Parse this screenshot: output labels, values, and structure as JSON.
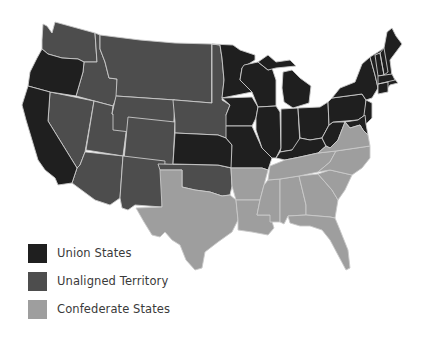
{
  "map": {
    "subject": "United States during the Civil War",
    "colors": {
      "union": "#1f1f1f",
      "unaligned": "#4d4d4d",
      "confederate": "#9e9e9e",
      "border": "#c9c9c9",
      "background": "#ffffff"
    },
    "regions": {
      "union": [
        "Washington? no",
        "Oregon",
        "California",
        "Kansas",
        "Minnesota",
        "Iowa",
        "Missouri",
        "Wisconsin",
        "Illinois",
        "Michigan",
        "Indiana",
        "Ohio",
        "Kentucky",
        "West Virginia",
        "Pennsylvania",
        "New York",
        "New Jersey",
        "Delaware",
        "Maryland",
        "Connecticut",
        "Rhode Island",
        "Massachusetts",
        "Vermont",
        "New Hampshire",
        "Maine"
      ],
      "unaligned": [
        "Washington",
        "Idaho",
        "Montana",
        "Nevada",
        "Utah",
        "Wyoming",
        "Colorado",
        "Arizona",
        "New Mexico",
        "North Dakota",
        "South Dakota",
        "Nebraska",
        "Oklahoma"
      ],
      "confederate": [
        "Texas",
        "Arkansas",
        "Louisiana",
        "Mississippi",
        "Alabama",
        "Georgia",
        "Florida",
        "Tennessee",
        "South Carolina",
        "North Carolina",
        "Virginia"
      ]
    }
  },
  "legend": {
    "items": [
      {
        "label": "Union States",
        "color": "#1f1f1f"
      },
      {
        "label": "Unaligned Territory",
        "color": "#4d4d4d"
      },
      {
        "label": "Confederate States",
        "color": "#9e9e9e"
      }
    ]
  }
}
